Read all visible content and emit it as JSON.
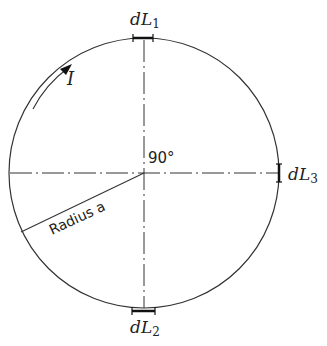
{
  "diagram": {
    "labels": {
      "dL1": {
        "main": "dL",
        "sub": "1"
      },
      "dL2": {
        "main": "dL",
        "sub": "2"
      },
      "dL3": {
        "main": "dL",
        "sub": "3"
      },
      "current": "I",
      "angle": "90°",
      "radius": "Radius a"
    },
    "colors": {
      "stroke": "#222222",
      "background": "#ffffff"
    }
  }
}
